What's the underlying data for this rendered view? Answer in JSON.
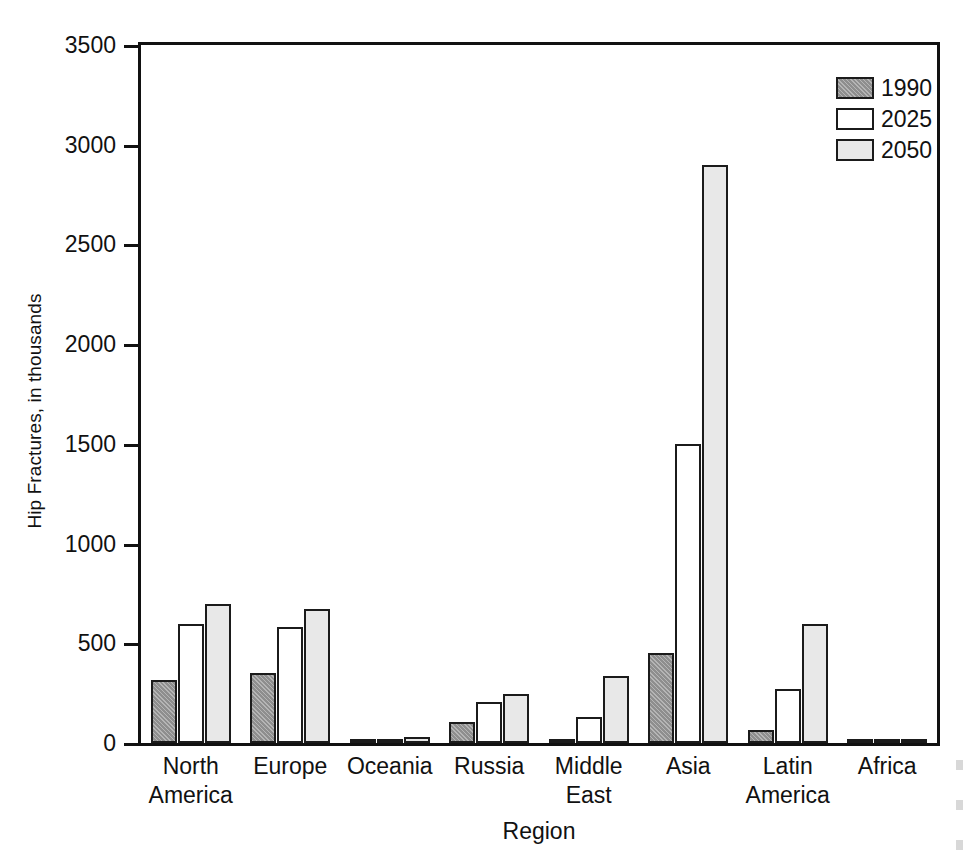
{
  "chart_data": {
    "type": "bar",
    "title": "",
    "xlabel": "Region",
    "ylabel": "Hip Fractures, in thousands",
    "ylim": [
      0,
      3500
    ],
    "yticks": [
      0,
      500,
      1000,
      1500,
      2000,
      2500,
      3000,
      3500
    ],
    "ytick_labels": [
      "0",
      "500",
      "1000",
      "1500",
      "2000",
      "2500",
      "3000",
      "3500"
    ],
    "grid": false,
    "legend_position": "top-right",
    "categories": [
      "North America",
      "Europe",
      "Oceania",
      "Russia",
      "Middle East",
      "Asia",
      "Latin America",
      "Africa"
    ],
    "category_lines": [
      [
        "North",
        "America"
      ],
      [
        "Europe"
      ],
      [
        "Oceania"
      ],
      [
        "Russia"
      ],
      [
        "Middle",
        "East"
      ],
      [
        "Asia"
      ],
      [
        "Latin",
        "America"
      ],
      [
        "Africa"
      ]
    ],
    "series": [
      {
        "name": "1990",
        "color": "#8e8e8e",
        "values": [
          315,
          350,
          3,
          105,
          20,
          450,
          65,
          3
        ]
      },
      {
        "name": "2025",
        "color": "#ffffff",
        "values": [
          595,
          580,
          15,
          205,
          130,
          1500,
          270,
          8
        ]
      },
      {
        "name": "2050",
        "color": "#e8e8e8",
        "values": [
          695,
          670,
          30,
          245,
          335,
          2900,
          595,
          18
        ]
      }
    ]
  },
  "legend": {
    "entries": [
      {
        "label": "1990",
        "swatch": "legend-swatch-1990"
      },
      {
        "label": "2025",
        "swatch": "legend-swatch-2025"
      },
      {
        "label": "2050",
        "swatch": "legend-swatch-2050"
      }
    ]
  },
  "colors": {
    "axis": "#111111",
    "series_1990": "#8e8e8e",
    "series_2025": "#ffffff",
    "series_2050": "#e8e8e8",
    "background": "#ffffff"
  }
}
